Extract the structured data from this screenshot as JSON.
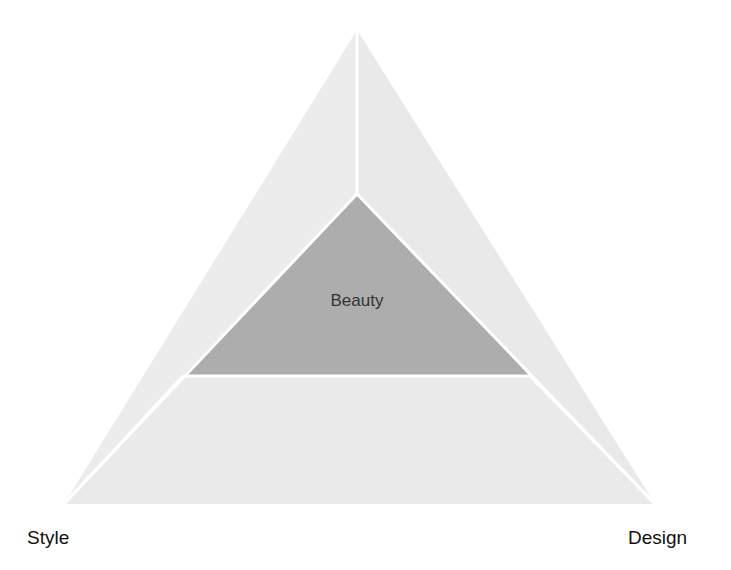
{
  "diagram": {
    "type": "triangle-pyramid",
    "center_label": "Beauty",
    "corner_labels": {
      "top": "",
      "bottom_left": "Style",
      "bottom_right": "Design"
    },
    "colors": {
      "outer_fill": "#ededed",
      "outer_fill_alt": "#e8e8e8",
      "inner_fill": "#adadad",
      "divider": "#ffffff",
      "text": "#111111",
      "center_text": "#333333"
    },
    "geometry": {
      "outer": {
        "apex": [
          357,
          30
        ],
        "bottom_left": [
          64,
          504
        ],
        "bottom_right": [
          655,
          504
        ]
      },
      "inner": {
        "apex": [
          357,
          194
        ],
        "left": [
          183,
          376
        ],
        "right": [
          530,
          376
        ]
      }
    }
  }
}
